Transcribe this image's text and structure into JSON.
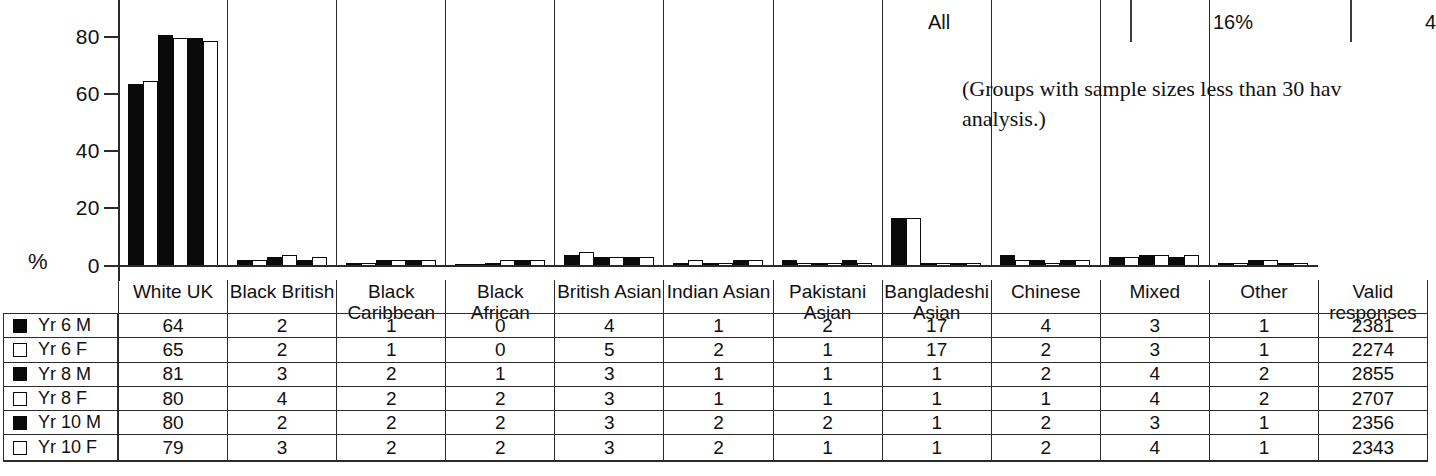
{
  "chart_data": {
    "type": "bar",
    "title": "",
    "xlabel": "",
    "ylabel": "%",
    "ylim": [
      0,
      90
    ],
    "yticks": [
      0,
      20,
      40,
      60,
      80
    ],
    "grid": false,
    "legend_position": "table-left-column",
    "categories": [
      "White UK",
      "Black British",
      "Black Caribbean",
      "Black African",
      "British Asian",
      "Indian Asian",
      "Pakistani Asian",
      "Bangladeshi Asian",
      "Chinese",
      "Mixed",
      "Other"
    ],
    "series": [
      {
        "name": "Yr 6 M",
        "fill": "black",
        "values": [
          64,
          2,
          1,
          0,
          4,
          1,
          2,
          17,
          4,
          3,
          1
        ],
        "valid_responses": 2381
      },
      {
        "name": "Yr 6 F",
        "fill": "white",
        "values": [
          65,
          2,
          1,
          0,
          5,
          2,
          1,
          17,
          2,
          3,
          1
        ],
        "valid_responses": 2274
      },
      {
        "name": "Yr 8 M",
        "fill": "black",
        "values": [
          81,
          3,
          2,
          1,
          3,
          1,
          1,
          1,
          2,
          4,
          2
        ],
        "valid_responses": 2855
      },
      {
        "name": "Yr 8 F",
        "fill": "white",
        "values": [
          80,
          4,
          2,
          2,
          3,
          1,
          1,
          1,
          1,
          4,
          2
        ],
        "valid_responses": 2707
      },
      {
        "name": "Yr 10 M",
        "fill": "black",
        "values": [
          80,
          2,
          2,
          2,
          3,
          2,
          2,
          1,
          2,
          3,
          1
        ],
        "valid_responses": 2356
      },
      {
        "name": "Yr 10 F",
        "fill": "white",
        "values": [
          79,
          3,
          2,
          2,
          3,
          2,
          1,
          1,
          2,
          4,
          1
        ],
        "valid_responses": 2343
      }
    ]
  },
  "axis": {
    "percent_symbol": "%",
    "ticks": [
      "80",
      "60",
      "40",
      "20",
      "0"
    ]
  },
  "table": {
    "valid_responses_header": "Valid responses",
    "valid_responses_header_line1": "Valid",
    "valid_responses_header_line2": "responses",
    "headers": [
      {
        "line1": "White UK",
        "line2": ""
      },
      {
        "line1": "Black British",
        "line2": ""
      },
      {
        "line1": "Black",
        "line2": "Caribbean"
      },
      {
        "line1": "Black African",
        "line2": ""
      },
      {
        "line1": "British Asian",
        "line2": ""
      },
      {
        "line1": "Indian Asian",
        "line2": ""
      },
      {
        "line1": "Pakistani",
        "line2": "Asian"
      },
      {
        "line1": "Bangladeshi",
        "line2": "Asian"
      },
      {
        "line1": "Chinese",
        "line2": ""
      },
      {
        "line1": "Mixed",
        "line2": ""
      },
      {
        "line1": "Other",
        "line2": ""
      }
    ],
    "rows": [
      {
        "label": "Yr 6 M",
        "swatch": "filled",
        "values": [
          "64",
          "2",
          "1",
          "0",
          "4",
          "1",
          "2",
          "17",
          "4",
          "3",
          "1"
        ],
        "valid": "2381"
      },
      {
        "label": "Yr 6 F",
        "swatch": "open",
        "values": [
          "65",
          "2",
          "1",
          "0",
          "5",
          "2",
          "1",
          "17",
          "2",
          "3",
          "1"
        ],
        "valid": "2274"
      },
      {
        "label": "Yr 8 M",
        "swatch": "filled",
        "values": [
          "81",
          "3",
          "2",
          "1",
          "3",
          "1",
          "1",
          "1",
          "2",
          "4",
          "2"
        ],
        "valid": "2855"
      },
      {
        "label": "Yr 8 F",
        "swatch": "open",
        "values": [
          "80",
          "4",
          "2",
          "2",
          "3",
          "1",
          "1",
          "1",
          "1",
          "4",
          "2"
        ],
        "valid": "2707"
      },
      {
        "label": "Yr 10 M",
        "swatch": "filled",
        "values": [
          "80",
          "2",
          "2",
          "2",
          "3",
          "2",
          "2",
          "1",
          "2",
          "3",
          "1"
        ],
        "valid": "2356"
      },
      {
        "label": "Yr 10 F",
        "swatch": "open",
        "values": [
          "79",
          "3",
          "2",
          "2",
          "3",
          "2",
          "1",
          "1",
          "2",
          "4",
          "1"
        ],
        "valid": "2343"
      }
    ]
  },
  "fragment": {
    "label": "All",
    "value1": "16%",
    "value2": "4"
  },
  "caption": {
    "line1": "(Groups with sample sizes less than 30 hav",
    "line2": "analysis.)"
  },
  "colors": {
    "ink": "#111111",
    "rule": "#2b2b2b",
    "bar_filled": "#0a0a0a",
    "bar_open": "#ffffff",
    "background": "#ffffff"
  }
}
